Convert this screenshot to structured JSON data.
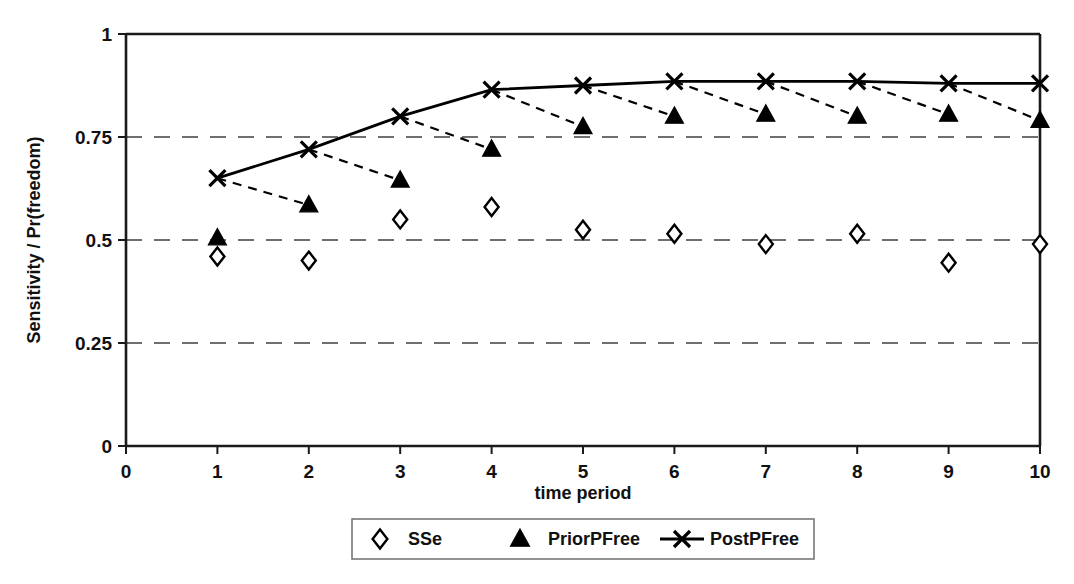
{
  "chart_data": {
    "type": "line",
    "title": "",
    "xlabel": "time period",
    "ylabel": "Sensitivity / Pr(freedom)",
    "xlim": [
      0,
      10
    ],
    "ylim": [
      0,
      1
    ],
    "x": [
      1,
      2,
      3,
      4,
      5,
      6,
      7,
      8,
      9,
      10
    ],
    "xticks": [
      "0",
      "1",
      "2",
      "3",
      "4",
      "5",
      "6",
      "7",
      "8",
      "9",
      "10"
    ],
    "xtick_values": [
      0,
      1,
      2,
      3,
      4,
      5,
      6,
      7,
      8,
      9,
      10
    ],
    "yticks": [
      "0",
      "0.25",
      "0.5",
      "0.75",
      "1"
    ],
    "ytick_values": [
      0,
      0.25,
      0.5,
      0.75,
      1
    ],
    "grid": "horizontal-dashed-at-0.25-0.5-0.75",
    "legend_position": "bottom-center",
    "series": [
      {
        "name": "SSe",
        "marker": "open-diamond",
        "line": "none",
        "values": [
          0.46,
          0.45,
          0.55,
          0.58,
          0.525,
          0.515,
          0.49,
          0.515,
          0.445,
          0.49
        ]
      },
      {
        "name": "PriorPFree",
        "marker": "filled-triangle",
        "line": "none",
        "values": [
          0.505,
          0.585,
          0.645,
          0.72,
          0.775,
          0.8,
          0.805,
          0.8,
          0.805,
          0.79
        ]
      },
      {
        "name": "PostPFree",
        "marker": "cross-x",
        "line": "solid",
        "values": [
          0.65,
          0.72,
          0.8,
          0.865,
          0.875,
          0.885,
          0.885,
          0.885,
          0.88,
          0.88
        ]
      }
    ],
    "connectors": {
      "description": "dashed segments from each PostPFree point at period n to the PriorPFree point at period n+1",
      "style": "dashed",
      "from_series": "PostPFree",
      "to_series": "PriorPFree",
      "offset": 1
    }
  },
  "legend": {
    "entries": [
      {
        "label": "SSe",
        "marker": "open-diamond"
      },
      {
        "label": "PriorPFree",
        "marker": "filled-triangle"
      },
      {
        "label": "PostPFree",
        "marker": "cross-x-with-line"
      }
    ]
  },
  "colors": {
    "ink": "#111111",
    "grid": "#6f6f6f",
    "background": "#ffffff",
    "legend_border": "#777777"
  }
}
